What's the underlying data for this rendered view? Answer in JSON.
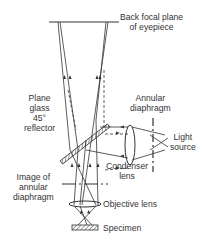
{
  "diagram": {
    "labels": {
      "back_focal_plane_line1": "Back focal plane",
      "back_focal_plane_line2": "of eyepiece",
      "reflector_line1": "Plane",
      "reflector_line2": "glass",
      "reflector_line3": "45°",
      "reflector_line4": "reflector",
      "annular_diaphragm_line1": "Annular",
      "annular_diaphragm_line2": "diaphragm",
      "light_source_line1": "Light",
      "light_source_line2": "source",
      "condenser_line1": "Condenser",
      "condenser_line2": "lens",
      "image_annular_line1": "Image of",
      "image_annular_line2": "annular",
      "image_annular_line3": "diaphragm",
      "objective_lens": "Objective lens",
      "specimen": "Specimen"
    },
    "colors": {
      "line": "#333333",
      "background": "#ffffff"
    }
  }
}
